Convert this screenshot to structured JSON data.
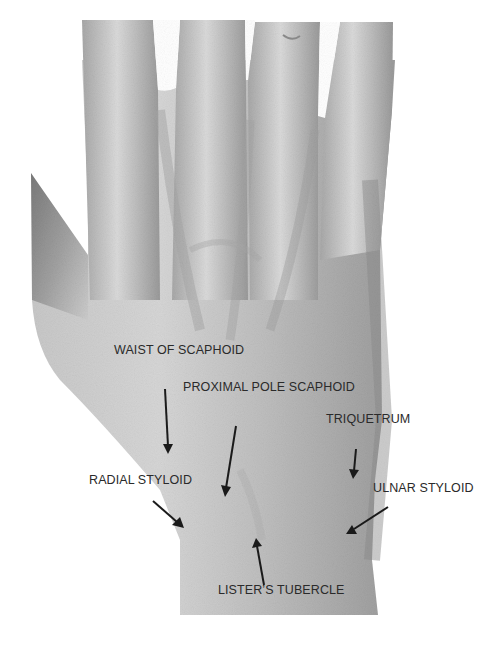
{
  "figure": {
    "colors": {
      "skin_light": "#d2d2d2",
      "skin_mid": "#b4b4b4",
      "skin_dark": "#8a8a8a",
      "text": "#2a2a2a",
      "arrow": "#1a1a1a",
      "background": "#ffffff"
    },
    "labels": [
      {
        "id": "waist-of-scaphoid",
        "text": "WAIST OF SCAPHOID",
        "x": 114,
        "y": 351,
        "arrow": {
          "x1": 165,
          "y1": 389,
          "x2": 168,
          "y2": 452
        }
      },
      {
        "id": "proximal-pole-scaphoid",
        "text": "PROXIMAL POLE SCAPHOID",
        "x": 183,
        "y": 387,
        "arrow": {
          "x1": 236,
          "y1": 426,
          "x2": 225,
          "y2": 495
        }
      },
      {
        "id": "triquetrum",
        "text": "TRIQUETRUM",
        "x": 326,
        "y": 419,
        "arrow": {
          "x1": 356,
          "y1": 449,
          "x2": 353,
          "y2": 477
        }
      },
      {
        "id": "radial-styloid",
        "text": "RADIAL STYLOID",
        "x": 89,
        "y": 480,
        "arrow": {
          "x1": 153,
          "y1": 501,
          "x2": 183,
          "y2": 527
        }
      },
      {
        "id": "ulnar-styloid",
        "text": "ULNAR STYLOID",
        "x": 373,
        "y": 488,
        "arrow": {
          "x1": 388,
          "y1": 507,
          "x2": 348,
          "y2": 533
        }
      },
      {
        "id": "listers-tubercle",
        "text": "LISTER’S TUBERCLE",
        "x": 218,
        "y": 590,
        "arrow": {
          "x1": 264,
          "y1": 585,
          "x2": 256,
          "y2": 540
        }
      }
    ]
  }
}
